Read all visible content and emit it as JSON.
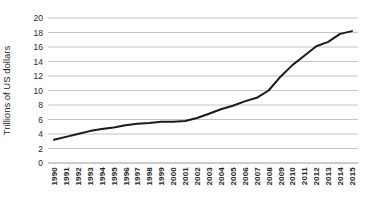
{
  "chart_data": {
    "type": "line",
    "title": "",
    "xlabel": "",
    "ylabel": "Trillions of US dollars",
    "categories": [
      "1990",
      "1991",
      "1992",
      "1993",
      "1994",
      "1995",
      "1996",
      "1997",
      "1998",
      "1999",
      "2000",
      "2001",
      "2002",
      "2003",
      "2004",
      "2005",
      "2006",
      "2007",
      "2008",
      "2009",
      "2010",
      "2011",
      "2012",
      "2013",
      "2014",
      "2015"
    ],
    "series": [
      {
        "name": "trillions-of-us-dollars",
        "values": [
          3.2,
          3.6,
          4.0,
          4.4,
          4.7,
          4.9,
          5.2,
          5.4,
          5.5,
          5.7,
          5.7,
          5.8,
          6.2,
          6.8,
          7.4,
          7.9,
          8.5,
          9.0,
          10.0,
          11.9,
          13.5,
          14.8,
          16.1,
          16.7,
          17.8,
          18.2
        ]
      }
    ],
    "ylim": [
      0,
      20
    ],
    "ytick_step": 2,
    "grid": true,
    "legend_position": "none",
    "colors": {
      "line": "#1a1a1a",
      "gridline": "#c4c4c4",
      "axis_line": "#9a9a9a",
      "tick_label": "#1f1f1f",
      "axis_title": "#1f1f1f",
      "background": "#ffffff"
    }
  }
}
